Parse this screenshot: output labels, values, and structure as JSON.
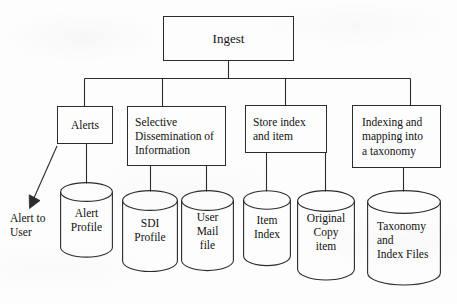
{
  "diagram": {
    "title_node": {
      "label": "Ingest"
    },
    "process_nodes": [
      {
        "id": "alerts",
        "label": "Alerts"
      },
      {
        "id": "sdi",
        "label": "Selective\nDissemination of\nInformation"
      },
      {
        "id": "store-index",
        "label": "Store index\nand item"
      },
      {
        "id": "indexing",
        "label": "Indexing and\nmapping into\na taxonomy"
      }
    ],
    "data_stores": [
      {
        "id": "alert-profile",
        "label": "Alert\nProfile"
      },
      {
        "id": "sdi-profile",
        "label": "SDI\nProfile"
      },
      {
        "id": "user-mail-file",
        "label": "User\nMail\nfile"
      },
      {
        "id": "item-index",
        "label": "Item\nIndex"
      },
      {
        "id": "original-copy-item",
        "label": "Original\nCopy\nitem"
      },
      {
        "id": "taxonomy-index-files",
        "label": "Taxonomy\nand\nIndex Files"
      }
    ],
    "output_labels": [
      {
        "id": "alert-to-user",
        "label": "Alert to\nUser"
      }
    ],
    "colors": {
      "stroke": "#2b2b2b",
      "background": "#fdfdfd",
      "text": "#111111"
    }
  }
}
